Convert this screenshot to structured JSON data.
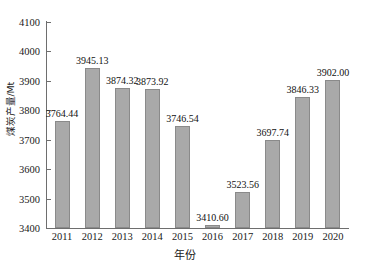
{
  "chart_data": {
    "type": "bar",
    "title": "",
    "subtitle": "",
    "xlabel": "年份",
    "ylabel": "煤炭产量/Mt",
    "categories": [
      "2011",
      "2012",
      "2013",
      "2014",
      "2015",
      "2016",
      "2017",
      "2018",
      "2019",
      "2020"
    ],
    "values": [
      3764.44,
      3945.13,
      3874.32,
      3873.92,
      3746.54,
      3410.6,
      3523.56,
      3697.74,
      3846.33,
      3902.0
    ],
    "value_labels": [
      "3764.44",
      "3945.13",
      "3874.32",
      "3873.92",
      "3746.54",
      "3410.60",
      "3523.56",
      "3697.74",
      "3846.33",
      "3902.00"
    ],
    "ylim": [
      3400,
      4100
    ],
    "yticks": [
      3400,
      3500,
      3600,
      3700,
      3800,
      3900,
      4000,
      4100
    ],
    "ytick_labels": [
      "3400",
      "3500",
      "3600",
      "3700",
      "3800",
      "3900",
      "4000",
      "4100"
    ],
    "grid": false,
    "legend": null,
    "legend_position": "none",
    "colors": {
      "bar_fill": "#a9a9a9",
      "bar_edge": "#8a8a8a",
      "axis": "#6e6e6e",
      "text": "#1a1a1a",
      "background": "#ffffff"
    }
  }
}
